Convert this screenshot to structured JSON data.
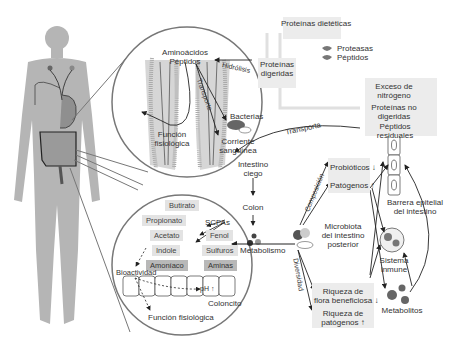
{
  "top": {
    "dietary_proteins": "Proteínas dietéticas",
    "proteases": "Proteasas",
    "peptides": "Péptidos",
    "digested_proteins": [
      "Proteínas",
      "digeridas"
    ]
  },
  "residual_box": {
    "excess_nitrogen": [
      "Exceso de",
      "nitrógeno"
    ],
    "undigested_proteins": [
      "Proteínas no",
      "digeridas"
    ],
    "residual_peptides": [
      "Péptidos",
      "residuales"
    ]
  },
  "small_intestine_circle": {
    "amino_acids": "Aminoácidos",
    "peptides": "Péptidos",
    "hydrolysis": "Hidrólisis",
    "transport_inner": "Transporte",
    "bacteria": "Bacterias",
    "physiological_function": [
      "Función",
      "fisiológica"
    ],
    "bloodstream": [
      "Corriente",
      "sanguínea"
    ]
  },
  "flow": {
    "transport": "Transporta",
    "cecum": [
      "Intestino",
      "ciego"
    ],
    "colon": "Colon",
    "metabolism": "Metabolismo",
    "composition": "Composición",
    "diversity": "Diversidad",
    "microbiota": [
      "Microbiota",
      "del intestino",
      "posterior"
    ],
    "probiotics": "Probióticos ↓",
    "pathogens": "Patógenos ↑",
    "beneficial_richness": [
      "Riqueza de",
      "flora beneficiosa ↓"
    ],
    "pathogen_richness": [
      "Riqueza de",
      "patógenos ↑"
    ],
    "epithelial_barrier": [
      "Barrera epitelial",
      "del intestino"
    ],
    "immune_system": [
      "Sistema",
      "inmune"
    ],
    "metabolites": "Metabolitos"
  },
  "colon_circle": {
    "butyrate": "Butirato",
    "scfas": "SCFAs",
    "propionate": "Propionato",
    "acetate": "Acetato",
    "phenol": "Fenol",
    "indole": "Indole",
    "sulfides": "Sulfuros",
    "ammonia": "Amoníaco",
    "amines": "Aminas",
    "bioactivity": "Bioactividad",
    "ph": "pH ↑",
    "colonocyte": "Coloncito",
    "physiological_function": "Función fisiológica"
  },
  "colors": {
    "body": "#b5b5b5",
    "box_bg": "#ececec",
    "dark_dot": "#4a4a4a",
    "mid_dot": "#8a8a8a"
  }
}
